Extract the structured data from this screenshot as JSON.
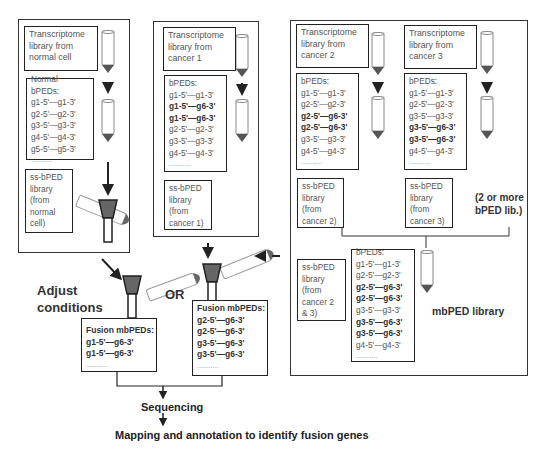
{
  "panels": {
    "normal": {
      "transcriptome": "Transcriptome library from normal cell",
      "bped_title_lines": [
        "Normal",
        "bPEDs:"
      ],
      "bpeds": [
        {
          "text": "g1-5'—g1-3'",
          "fusion": false
        },
        {
          "text": "g2-5'—g2-3'",
          "fusion": false
        },
        {
          "text": "g3-5'—g3-3'",
          "fusion": false
        },
        {
          "text": "g4-5'—g4-3'",
          "fusion": false
        },
        {
          "text": "g5-5'—g5-3'",
          "fusion": false
        }
      ],
      "ellipsis": "...........",
      "ss_lines": [
        "ss-bPED",
        "library",
        "(from",
        "normal",
        "cell)"
      ]
    },
    "cancer1": {
      "transcriptome_lines": [
        "Transcriptome",
        "library from",
        "cancer 1"
      ],
      "bped_title": "bPEDs:",
      "bpeds": [
        {
          "text": "g1-5'—g1-3'",
          "fusion": false
        },
        {
          "text": "g1-5'—g6-3'",
          "fusion": true
        },
        {
          "text": "g1-5'—g6-3'",
          "fusion": true
        },
        {
          "text": "g2-5'—g2-3'",
          "fusion": false
        },
        {
          "text": "g3-5'—g3-3'",
          "fusion": false
        },
        {
          "text": "g4-5'—g4-3'",
          "fusion": false
        }
      ],
      "ellipsis": "...........",
      "ss_lines": [
        "ss-bPED",
        "library",
        "(from",
        "cancer 1)"
      ]
    },
    "cancer2": {
      "transcriptome_lines": [
        "Transcriptome",
        "library from",
        "cancer 2"
      ],
      "bped_title": "bPEDs:",
      "bpeds": [
        {
          "text": "g1-5'—g1-3'",
          "fusion": false
        },
        {
          "text": "g2-5'—g2-3'",
          "fusion": false
        },
        {
          "text": "g2-5'—g6-3'",
          "fusion": true
        },
        {
          "text": "g2-5'—g6-3'",
          "fusion": true
        },
        {
          "text": "g3-5'—g3-3'",
          "fusion": false
        },
        {
          "text": "g4-5'—g4-3'",
          "fusion": false
        }
      ],
      "ellipsis": "...........",
      "ss_lines": [
        "ss-bPED",
        "library",
        "(from",
        "cancer 2)"
      ]
    },
    "cancer3": {
      "transcriptome_lines": [
        "Transcriptome",
        "library from",
        "cancer 3"
      ],
      "bped_title": "bPEDs:",
      "bpeds": [
        {
          "text": "g1-5'—g1-3'",
          "fusion": false
        },
        {
          "text": "g2-5'—g2-3'",
          "fusion": false
        },
        {
          "text": "g3-5'—g3-3'",
          "fusion": false
        },
        {
          "text": "g3-5'—g6-3'",
          "fusion": true
        },
        {
          "text": "g3-5'—g6-3'",
          "fusion": true
        },
        {
          "text": "g4-5'—g4-3'",
          "fusion": false
        }
      ],
      "ellipsis": "...........",
      "ss_lines": [
        "ss-bPED",
        "library",
        "(from",
        "cancer 3)"
      ]
    },
    "combined": {
      "note_lines": [
        "(2 or more",
        "bPED lib.)"
      ],
      "ss_lines": [
        "ss-bPED",
        "library",
        "(from",
        "cancer 2",
        "& 3)"
      ],
      "bped_title": "bPEDs:",
      "bpeds": [
        {
          "text": "g1-5'—g1-3'",
          "fusion": false
        },
        {
          "text": "g2-5'—g2-3'",
          "fusion": false
        },
        {
          "text": "g2-5'—g6-3'",
          "fusion": true
        },
        {
          "text": "g2-5'—g6-3'",
          "fusion": true
        },
        {
          "text": "g3-5'—g3-3'",
          "fusion": false
        },
        {
          "text": "g3-5'—g6-3'",
          "fusion": true
        },
        {
          "text": "g3-5'—g6-3'",
          "fusion": true
        },
        {
          "text": "g4-5'—g4-3'",
          "fusion": false
        }
      ],
      "ellipsis": "...........",
      "library_label": "mbPED library"
    }
  },
  "adjust_lines": [
    "Adjust",
    "conditions"
  ],
  "or_label": "OR",
  "fusion_left": {
    "title": "Fusion mbPEDs:",
    "items": [
      "g1-5'—g6-3'",
      "g1-5'—g6-3'"
    ],
    "ellipsis": "..........."
  },
  "fusion_right": {
    "title": "Fusion mbPEDs:",
    "items": [
      "g2-5'—g6-3'",
      "g2-5'—g6-3'",
      "g3-5'—g6-3'",
      "g3-5'—g6-3'"
    ],
    "ellipsis": "..........."
  },
  "sequencing": "Sequencing",
  "mapping": "Mapping and annotation to identify fusion genes",
  "colors": {
    "tube_tip": "#555555",
    "column_fill": "#666666",
    "border": "#222222"
  }
}
